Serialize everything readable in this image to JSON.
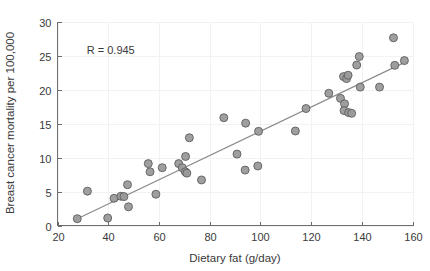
{
  "chart_data": {
    "type": "scatter",
    "title": "",
    "xlabel": "Dietary fat (g/day)",
    "ylabel": "Breast cancer mortality per 100,000",
    "xlim": [
      20,
      160
    ],
    "ylim": [
      0,
      30
    ],
    "xticks": [
      20,
      40,
      60,
      80,
      100,
      120,
      140,
      160
    ],
    "yticks": [
      0,
      5,
      10,
      15,
      20,
      25,
      30
    ],
    "xtick_labels": [
      "20",
      "40",
      "60",
      "80",
      "100",
      "120",
      "140",
      "160"
    ],
    "ytick_labels": [
      "0",
      "5",
      "10",
      "15",
      "20",
      "25",
      "30"
    ],
    "grid": true,
    "legend": "none",
    "annotations": [
      {
        "text": "R = 0.945",
        "x": 41,
        "y": 25.2
      }
    ],
    "marker_color": "#9a9a9a",
    "marker_edge_color": "#5e5e5e",
    "line_color": "#8c8c8c",
    "axis_color": "#6e6e6e",
    "grid_color": "#f2f2f2",
    "background_color": "#ffffff",
    "series": [
      {
        "name": "Countries",
        "points": [
          [
            27.8,
            1.0
          ],
          [
            31.8,
            5.05
          ],
          [
            39.8,
            1.1
          ],
          [
            42.3,
            4.0
          ],
          [
            45.0,
            4.3
          ],
          [
            46.2,
            4.25
          ],
          [
            47.6,
            6.0
          ],
          [
            48.0,
            2.75
          ],
          [
            55.8,
            9.1
          ],
          [
            56.5,
            7.9
          ],
          [
            58.8,
            4.6
          ],
          [
            61.3,
            8.5
          ],
          [
            67.8,
            9.1
          ],
          [
            69.2,
            8.5
          ],
          [
            70.5,
            10.15
          ],
          [
            70.4,
            7.9
          ],
          [
            71.0,
            7.7
          ],
          [
            72.0,
            12.9
          ],
          [
            76.8,
            6.7
          ],
          [
            85.6,
            15.85
          ],
          [
            90.8,
            10.5
          ],
          [
            94.2,
            15.05
          ],
          [
            94.0,
            8.15
          ],
          [
            99.0,
            8.75
          ],
          [
            99.3,
            13.85
          ],
          [
            113.8,
            13.9
          ],
          [
            118.0,
            17.2
          ],
          [
            127.0,
            19.45
          ],
          [
            131.6,
            18.7
          ],
          [
            132.8,
            21.9
          ],
          [
            133.2,
            17.9
          ],
          [
            133.0,
            16.9
          ],
          [
            134.0,
            21.6
          ],
          [
            134.6,
            22.1
          ],
          [
            134.8,
            16.6
          ],
          [
            136.0,
            16.5
          ],
          [
            138.0,
            23.6
          ],
          [
            139.0,
            24.85
          ],
          [
            139.4,
            20.35
          ],
          [
            147.0,
            20.35
          ],
          [
            152.5,
            27.6
          ],
          [
            153.0,
            23.55
          ],
          [
            156.8,
            24.25
          ]
        ]
      }
    ],
    "trend_line": {
      "name": "Linear fit",
      "x_start": 27.0,
      "y_start": 0.85,
      "x_end": 157.5,
      "y_end": 24.1
    }
  }
}
